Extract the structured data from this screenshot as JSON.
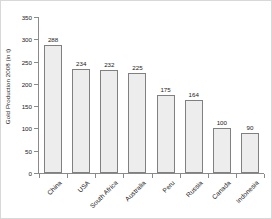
{
  "chart_data": {
    "type": "bar",
    "title": "",
    "xlabel": "",
    "ylabel": "Gold Production 2008 (in t)",
    "categories": [
      "China",
      "USA",
      "South Africa",
      "Australia",
      "Peru",
      "Russia",
      "Canada",
      "Indonesia"
    ],
    "values": [
      288,
      234,
      232,
      225,
      175,
      164,
      100,
      90
    ],
    "value_labels": [
      "288",
      "234",
      "232",
      "225",
      "175",
      "164",
      "100",
      "90"
    ],
    "ylim": [
      0,
      350
    ],
    "yticks": [
      0,
      50,
      100,
      150,
      200,
      250,
      300,
      350
    ],
    "ytick_labels": [
      "0",
      "50",
      "100",
      "150",
      "200",
      "250",
      "300",
      "350"
    ],
    "grid": false,
    "legend": false,
    "bar_fill_color": "#ededed",
    "bar_border_color": "#808080",
    "axis_color": "#8a8a8a",
    "text_color": "#1a1a1a",
    "background_color": "#ffffff"
  }
}
